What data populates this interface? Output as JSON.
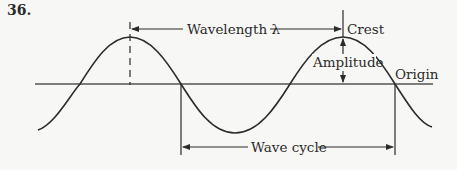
{
  "question_number": "36.",
  "labels": {
    "wavelength": "Wavelength λ",
    "crest": "Crest",
    "amplitude": "Amplitude",
    "origin": "Origin",
    "wave_cycle": "Wave cycle"
  },
  "colors": {
    "background": "#f7f7f5",
    "ink": "#2b2b2b",
    "baseline": "#555555"
  }
}
